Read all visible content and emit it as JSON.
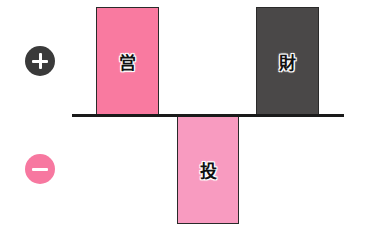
{
  "legend": {
    "positive": {
      "symbol": "+",
      "meaning": "plus",
      "color": "#3a3a3a"
    },
    "negative": {
      "symbol": "−",
      "meaning": "minus",
      "color": "#f778a0"
    }
  },
  "bars": [
    {
      "label": "営",
      "direction": "positive",
      "color": "#f97aa0"
    },
    {
      "label": "投",
      "direction": "negative",
      "color": "#f89bc0"
    },
    {
      "label": "財",
      "direction": "positive",
      "color": "#4a4848"
    }
  ]
}
